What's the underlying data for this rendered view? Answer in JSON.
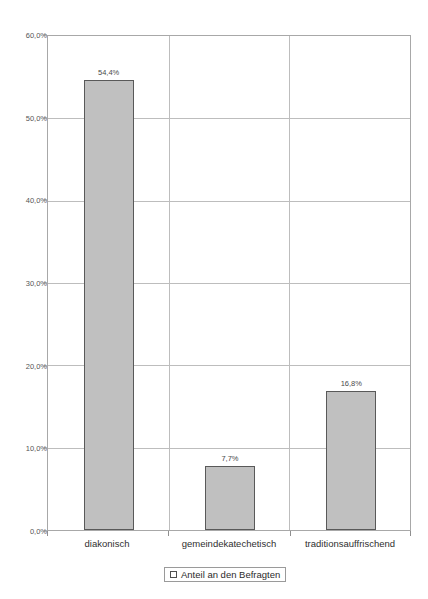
{
  "chart_data": {
    "type": "bar",
    "title": "",
    "xlabel": "",
    "ylabel": "",
    "categories": [
      "diakonisch",
      "gemeindekatechetisch",
      "traditionsauffrischend"
    ],
    "values": [
      54.4,
      7.7,
      16.8
    ],
    "data_labels": [
      "54,4%",
      "7,7%",
      "16,8%"
    ],
    "series": [
      {
        "name": "Anteil an den Befragten",
        "values": [
          54.4,
          7.7,
          16.8
        ]
      }
    ],
    "ylim": [
      0,
      60
    ],
    "ytick_values": [
      60,
      50,
      40,
      30,
      20,
      10,
      0
    ],
    "ytick_labels": [
      "60,0%",
      "50,0%",
      "40,0%",
      "30,0%",
      "20,0%",
      "10,0%",
      "0,0%"
    ],
    "grid": true,
    "legend_position": "bottom",
    "legend_entries": [
      "Anteil an den Befragten"
    ],
    "colors": {
      "bar_fill": "#c0c0c0",
      "bar_border": "#595959",
      "gridline": "#bdbdbd",
      "frame": "#a8a8a8",
      "text": "#2f2f2f",
      "tick_text": "#555555"
    }
  },
  "legend": {
    "label": "Anteil an den Befragten"
  }
}
